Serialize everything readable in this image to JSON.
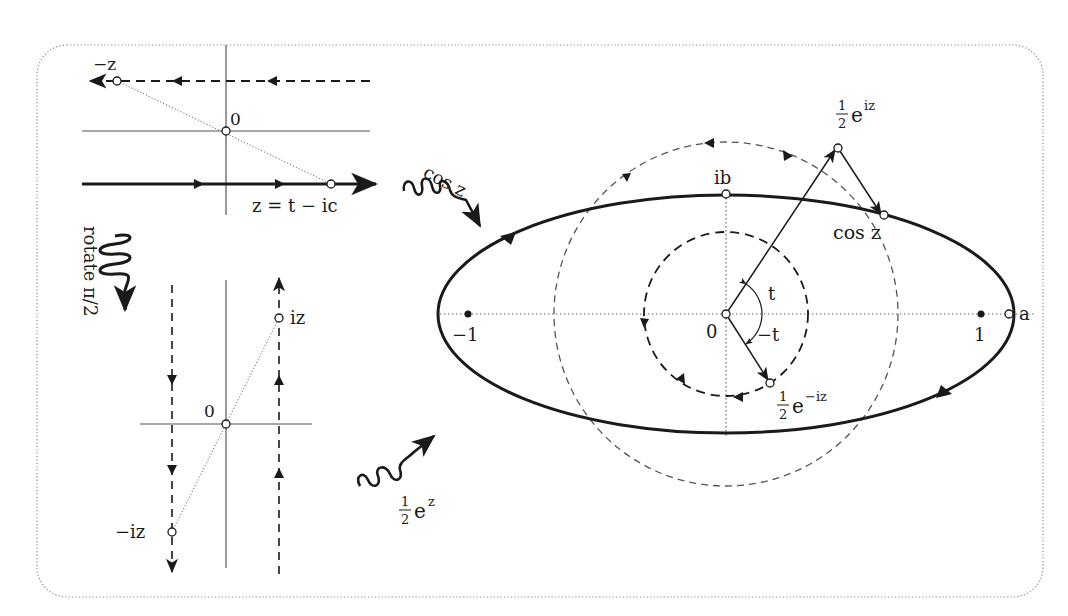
{
  "figure": {
    "border": {
      "style": "dotted",
      "color": "#8a8a8a"
    },
    "colors": {
      "ink": "#1a1a1a",
      "axis": "#555555",
      "dashed": "#444444",
      "dotted": "#666666"
    }
  },
  "top_left_panel": {
    "label_neg_z": "−z",
    "label_origin": "0",
    "label_path": "z = t − ic"
  },
  "rotate_arrow": {
    "label": "rotate  π/2"
  },
  "bottom_left_panel": {
    "label_origin": "0",
    "label_iz": "iz",
    "label_neg_iz": "−iz"
  },
  "map_arrows": {
    "cos": "cos z",
    "half_exp_num": "1",
    "half_exp_den": "2",
    "half_exp_base": "e",
    "half_exp_sup": "z"
  },
  "main_panel": {
    "label_ib": "ib",
    "label_origin": "0",
    "label_neg_one": "−1",
    "label_one": "1",
    "label_a": "a",
    "label_t": "t",
    "label_neg_t": "−t",
    "label_cos_z": "cos z",
    "half_eiz": {
      "num": "1",
      "den": "2",
      "base": "e",
      "sup": "iz"
    },
    "half_e_neg_iz": {
      "num": "1",
      "den": "2",
      "base": "e",
      "sup": "−iz"
    }
  }
}
